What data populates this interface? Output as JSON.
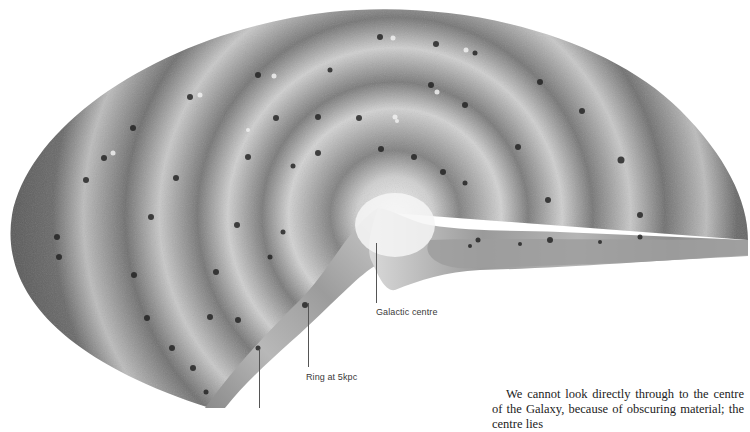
{
  "figure": {
    "colors": {
      "background": "#ffffff",
      "disk_dark": "#5e5e5e",
      "disk_mid": "#8a8a8a",
      "ring_light": "#d8d8d8",
      "centre_glow": "#f2f2f2",
      "cluster_dark": "#1a1a1a",
      "leader_line": "#555555"
    },
    "labels": {
      "galactic_centre": "Galactic centre",
      "ring_5kpc": "Ring at 5kpc"
    }
  },
  "body_text": {
    "paragraph": "We cannot look directly through to the centre of the Galaxy, because of obscuring material; the centre lies"
  }
}
